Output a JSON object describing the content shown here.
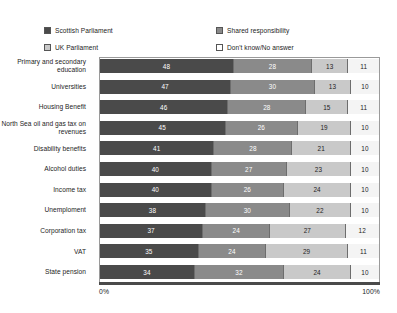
{
  "chart_data": {
    "type": "bar",
    "orientation": "horizontal",
    "stacked": true,
    "normalized_percent": true,
    "title": "",
    "subtitle": "",
    "xlabel": "",
    "ylabel": "",
    "xlim": [
      0,
      100
    ],
    "grid": false,
    "legend_position": "top",
    "axis_tick_labels": [
      "0%",
      "100%"
    ],
    "categories": [
      "Primary and secondary education",
      "Universities",
      "Housing Benefit",
      "North Sea oil and gas tax on revenues",
      "Disability benefits",
      "Alcohol duties",
      "Income tax",
      "Unemploment",
      "Corporation tax",
      "VAT",
      "State pension"
    ],
    "series": [
      {
        "name": "Scottish Parliament",
        "color": "#4a4a4a",
        "values": [
          48,
          47,
          46,
          45,
          41,
          40,
          40,
          38,
          37,
          35,
          34
        ]
      },
      {
        "name": "Shared responsibility",
        "color": "#8a8a8a",
        "values": [
          28,
          30,
          28,
          26,
          28,
          27,
          26,
          30,
          24,
          24,
          32
        ]
      },
      {
        "name": "UK Parliament",
        "color": "#c9c9c9",
        "values": [
          13,
          13,
          15,
          19,
          21,
          23,
          24,
          22,
          27,
          29,
          24
        ]
      },
      {
        "name": "Don't know/No answer",
        "color": "#f4f4f4",
        "values": [
          11,
          10,
          11,
          10,
          10,
          10,
          10,
          10,
          12,
          11,
          10
        ]
      }
    ]
  },
  "legend": {
    "entries": [
      {
        "label": "Scottish Parliament",
        "color": "#4a4a4a"
      },
      {
        "label": "Shared responsibility",
        "color": "#8a8a8a"
      },
      {
        "label": "UK Parliament",
        "color": "#c9c9c9"
      },
      {
        "label": "Don't know/No answer",
        "color": "#ffffff"
      }
    ]
  },
  "axis": {
    "min_label": "0%",
    "max_label": "100%"
  }
}
